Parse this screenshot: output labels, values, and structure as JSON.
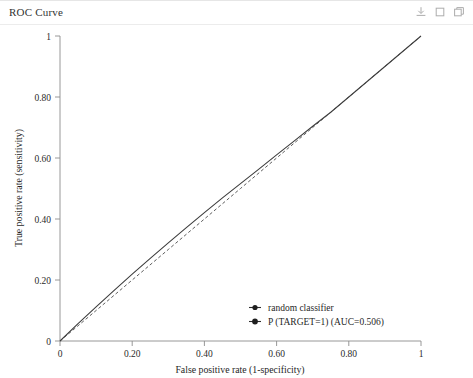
{
  "panel": {
    "title": "ROC Curve"
  },
  "toolbar": {
    "items": [
      {
        "name": "download-icon",
        "label": "download"
      },
      {
        "name": "copy-icon",
        "label": "copy"
      },
      {
        "name": "duplicate-icon",
        "label": "duplicate"
      }
    ]
  },
  "chart_data": {
    "type": "line",
    "title": "ROC Curve",
    "xlabel": "False positive rate (1-specificity)",
    "ylabel": "True positive rate (sensitivity)",
    "xlim": [
      0,
      1
    ],
    "ylim": [
      0,
      1
    ],
    "grid": false,
    "legend_position": "lower right",
    "xticks": [
      0,
      0.2,
      0.4,
      0.6,
      0.8,
      1
    ],
    "xtick_labels": [
      "0",
      "0.20",
      "0.40",
      "0.60",
      "0.80",
      "1"
    ],
    "yticks": [
      0,
      0.2,
      0.4,
      0.6,
      0.8,
      1
    ],
    "ytick_labels": [
      "0",
      "0.20",
      "0.40",
      "0.60",
      "0.80",
      "1"
    ],
    "series": [
      {
        "name": "random classifier",
        "style": "dashed",
        "color": "#555555",
        "x": [
          0,
          0.1,
          0.2,
          0.3,
          0.4,
          0.5,
          0.6,
          0.7,
          0.8,
          0.9,
          1
        ],
        "y": [
          0,
          0.1,
          0.2,
          0.3,
          0.4,
          0.5,
          0.6,
          0.7,
          0.8,
          0.9,
          1
        ]
      },
      {
        "name": "P (TARGET=1) (AUC=0.506)",
        "style": "solid",
        "color": "#3c3c3c",
        "auc": 0.506,
        "x": [
          0,
          0.05,
          0.1,
          0.15,
          0.2,
          0.25,
          0.3,
          0.35,
          0.4,
          0.45,
          0.5,
          0.55,
          0.6,
          0.65,
          0.7,
          0.75,
          0.8,
          0.85,
          0.9,
          0.95,
          1
        ],
        "y": [
          0,
          0.057,
          0.112,
          0.166,
          0.219,
          0.271,
          0.322,
          0.372,
          0.421,
          0.469,
          0.516,
          0.563,
          0.61,
          0.657,
          0.704,
          0.75,
          0.8,
          0.85,
          0.9,
          0.95,
          1
        ]
      }
    ],
    "legend": [
      {
        "label": "random classifier",
        "marker": "circle-line"
      },
      {
        "label": "P (TARGET=1) (AUC=0.506)",
        "marker": "circle-line"
      }
    ]
  }
}
